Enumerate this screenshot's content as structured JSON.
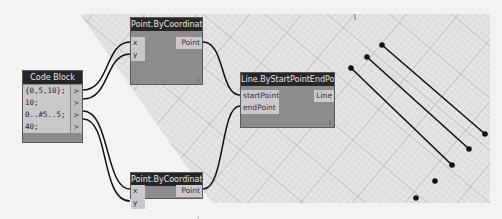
{
  "code_block": {
    "title": "Code Block",
    "lines": [
      "{0,5,10};",
      "10;",
      "0..#5..5;",
      "40;"
    ],
    "output_glyph": ">"
  },
  "point_top": {
    "title": "Point.ByCoordinates",
    "inputs": [
      "x",
      "y"
    ],
    "output": "Point",
    "footer_glyph": "ⅰ"
  },
  "point_bottom": {
    "title": "Point.ByCoordinates",
    "inputs": [
      "x",
      "y"
    ],
    "output": "Point",
    "footer_glyph": "ⅰ"
  },
  "line_node": {
    "title": "Line.ByStartPointEndPoint",
    "inputs": [
      "startPoint",
      "endPoint"
    ],
    "output": "Line",
    "footer_glyph": "ⅰ"
  },
  "colors": {
    "node_body": "#8c8c8c",
    "node_header": "#262626",
    "port": "#c9c9c9",
    "wire": "#111111",
    "grid": "#bdbdbd",
    "background": "#f3f3f3"
  }
}
